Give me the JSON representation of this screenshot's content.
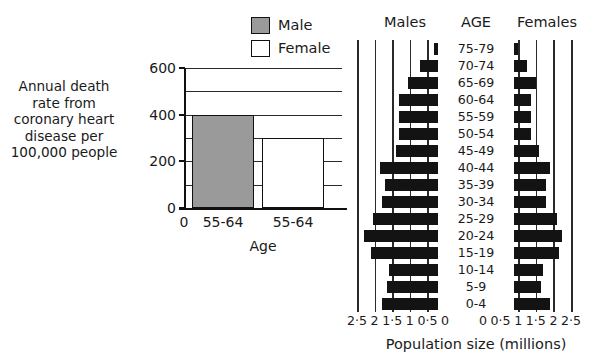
{
  "figure": {
    "panels": [
      "coronary-heart-disease-bar-chart",
      "population-pyramid"
    ]
  },
  "bar_panel": {
    "y_axis_caption": "Annual death rate from coronary heart disease per 100,000 people",
    "x_axis_title": "Age",
    "origin_label": "0",
    "legend": [
      {
        "label": "Male",
        "color": "#9a9a9a"
      },
      {
        "label": "Female",
        "color": "#ffffff"
      }
    ]
  },
  "pyramid_panel": {
    "left_heading": "Males",
    "center_heading": "AGE",
    "right_heading": "Females",
    "axis_title": "Population size (millions)",
    "male_tick_labels": [
      "2·5",
      "2",
      "1·5",
      "1",
      "0·5",
      "0"
    ],
    "female_tick_labels": [
      "0",
      "0·5",
      "1",
      "1·5",
      "2",
      "2·5"
    ],
    "bar_color": "#131313"
  },
  "chart_data": [
    {
      "type": "bar",
      "title": "",
      "xlabel": "Age",
      "ylabel": "Annual death rate from coronary heart disease per 100,000 people",
      "categories": [
        "55-64",
        "55-64"
      ],
      "series": [
        {
          "name": "Male",
          "values": [
            400,
            null
          ]
        },
        {
          "name": "Female",
          "values": [
            null,
            300
          ]
        }
      ],
      "values": [
        400,
        300
      ],
      "ylim": [
        0,
        600
      ],
      "yticks": [
        0,
        200,
        400,
        600
      ],
      "gridlines": [
        100,
        200,
        300,
        400,
        500,
        600
      ],
      "grid": true,
      "legend": [
        "Male",
        "Female"
      ],
      "legend_position": "top-right"
    },
    {
      "type": "bar",
      "subtype": "population-pyramid",
      "title": "",
      "xlabel": "Population size (millions)",
      "ylabel": "AGE",
      "categories": [
        "75-79",
        "70-74",
        "65-69",
        "60-64",
        "55-59",
        "50-54",
        "45-49",
        "40-44",
        "35-39",
        "30-34",
        "25-29",
        "20-24",
        "15-19",
        "10-14",
        "5-9",
        "0-4"
      ],
      "series": [
        {
          "name": "Males",
          "values": [
            0.3,
            0.7,
            1.05,
            1.3,
            1.3,
            1.3,
            1.4,
            1.85,
            1.7,
            1.8,
            2.05,
            2.3,
            2.1,
            1.6,
            1.65,
            1.8
          ]
        },
        {
          "name": "Females",
          "values": [
            1.0,
            1.25,
            1.5,
            1.35,
            1.35,
            1.35,
            1.6,
            1.9,
            1.8,
            1.8,
            2.1,
            2.25,
            2.15,
            1.7,
            1.65,
            1.9
          ]
        }
      ],
      "xlim": [
        0,
        2.5
      ],
      "xticks": [
        0,
        0.5,
        1,
        1.5,
        2,
        2.5
      ],
      "grid": true,
      "legend_position": "none"
    }
  ]
}
